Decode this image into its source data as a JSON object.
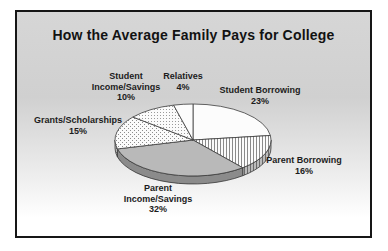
{
  "title": "How the Average Family Pays for College",
  "frame": {
    "border_color": "#161616",
    "background_top": "#d6d6d6",
    "background_bottom": "#ffffff"
  },
  "chart_data": {
    "type": "pie",
    "title": "How the Average Family Pays for College",
    "is_3d": true,
    "start_angle_deg": 0,
    "direction": "clockwise",
    "legend": "none",
    "slices": [
      {
        "label": "Student Borrowing",
        "value": 23,
        "pct_label": "23%",
        "fill": "white"
      },
      {
        "label": "Parent Borrowing",
        "value": 16,
        "pct_label": "16%",
        "fill": "vlines"
      },
      {
        "label": "Parent Income/Savings",
        "value": 32,
        "pct_label": "32%",
        "fill": "gray"
      },
      {
        "label": "Grants/Scholarships",
        "value": 15,
        "pct_label": "15%",
        "fill": "dots-coarse"
      },
      {
        "label": "Student Income/Savings",
        "value": 10,
        "pct_label": "10%",
        "fill": "dots-fine"
      },
      {
        "label": "Relatives",
        "value": 4,
        "pct_label": "4%",
        "fill": "white"
      }
    ],
    "colors": {
      "slice_white": "#fcfcfc",
      "slice_gray": "#b9b9b9",
      "pattern_ink": "#8c8c8c",
      "outline": "#3c3c3c",
      "side_shade": "rgba(20,20,20,0.28)"
    }
  }
}
